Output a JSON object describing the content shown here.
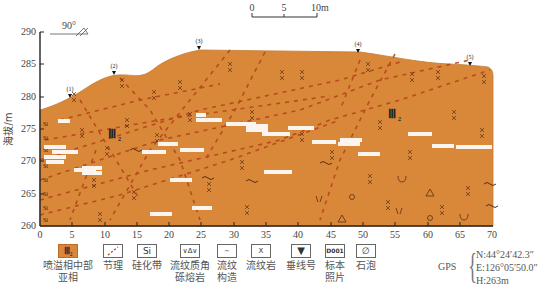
{
  "diagram": {
    "type": "geological-cross-section",
    "strike_dip_label": "90°",
    "scale_bar": {
      "ticks": [
        "0",
        "5",
        "10m"
      ]
    },
    "y_axis": {
      "label": "海拔/m",
      "ticks": [
        "260",
        "265",
        "270",
        "275",
        "280",
        "285",
        "290"
      ],
      "range": [
        260,
        290
      ]
    },
    "x_axis": {
      "ticks": [
        "0",
        "5",
        "10",
        "15",
        "20",
        "25",
        "30",
        "35",
        "40",
        "45",
        "50",
        "55",
        "60",
        "65",
        "70"
      ],
      "range": [
        0,
        70
      ]
    },
    "unit_labels": [
      {
        "text": "Ⅲ",
        "sub": "2",
        "x": 11,
        "y": 273
      },
      {
        "text": "Ⅲ",
        "sub": "2",
        "x": 57,
        "y": 275
      }
    ],
    "plumb_lines": [
      {
        "label": "(1)",
        "x": 5.5,
        "y": 279.6
      },
      {
        "label": "(2)",
        "x": 11.8,
        "y": 283.2
      },
      {
        "label": "(3)",
        "x": 25,
        "y": 286.9
      },
      {
        "label": "(4)",
        "x": 49,
        "y": 286.6
      },
      {
        "label": "(5)",
        "x": 67,
        "y": 284.5
      }
    ],
    "colors": {
      "fill": "#d9883a",
      "edge": "#b86c25",
      "joint": "#b8441c",
      "axis": "#222222"
    }
  },
  "legend": {
    "items": [
      {
        "label": "喷溢相中部亚相",
        "line1": "喷溢相中部",
        "line2": "亚相",
        "icon": "Ⅲ₂"
      },
      {
        "label": "节理",
        "line1": "节理",
        "line2": "",
        "icon": "joint"
      },
      {
        "label": "硅化带",
        "line1": "硅化带",
        "line2": "",
        "icon": "Si"
      },
      {
        "label": "流纹质角砾熔岩",
        "line1": "流纹质角",
        "line2": "砾熔岩",
        "icon": "∨∆∨"
      },
      {
        "label": "流纹构造",
        "line1": "流纹",
        "line2": "构造",
        "icon": "~"
      },
      {
        "label": "流纹岩",
        "line1": "流纹岩",
        "line2": "",
        "icon": "X"
      },
      {
        "label": "垂线号",
        "line1": "垂线号",
        "line2": "",
        "icon": "▼"
      },
      {
        "label": "标本照片",
        "line1": "标本",
        "line2": "照片",
        "icon": "D001"
      },
      {
        "label": "石泡",
        "line1": "石泡",
        "line2": "",
        "icon": "∅"
      }
    ]
  },
  "gps": {
    "label": "GPS",
    "lat": "N:44°24′42.3″",
    "lon": "E:126°05′50.0″",
    "elev": "H:263m"
  }
}
